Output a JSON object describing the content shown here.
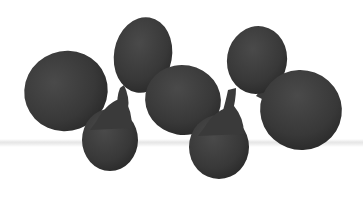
{
  "image": {
    "subject": "molecular orbital lobes (conjugated p-orbital chain)",
    "background_color": "#ffffff",
    "lobe_color": "#3a3a3a",
    "band_color": "#e6e6e6",
    "lobes": [
      {
        "id": "A",
        "cx": 66,
        "cy": 91,
        "rx": 42,
        "ry": 40,
        "rot": -20
      },
      {
        "id": "B",
        "cx": 143,
        "cy": 55,
        "rx": 29,
        "ry": 38,
        "rot": 10
      },
      {
        "id": "C",
        "cx": 110,
        "cy": 138,
        "rx": 29,
        "ry": 32,
        "rot": 0
      },
      {
        "id": "D",
        "cx": 183,
        "cy": 100,
        "rx": 38,
        "ry": 35,
        "rot": 10
      },
      {
        "id": "E",
        "cx": 257,
        "cy": 60,
        "rx": 30,
        "ry": 34,
        "rot": 10
      },
      {
        "id": "F",
        "cx": 219,
        "cy": 145,
        "rx": 31,
        "ry": 33,
        "rot": 0
      },
      {
        "id": "G",
        "cx": 301,
        "cy": 110,
        "rx": 41,
        "ry": 40,
        "rot": 20
      }
    ]
  }
}
